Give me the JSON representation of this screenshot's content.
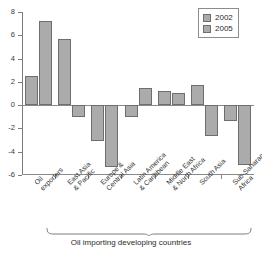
{
  "chart_data": {
    "type": "bar",
    "title": "",
    "xlabel": "",
    "ylabel": "",
    "ylim": [
      -6,
      8
    ],
    "grid": false,
    "legend_position": "top-right",
    "categories": [
      "Oil exporters",
      "East Asia & Pacific",
      "Europe & Central Asia",
      "Latin America & Caribbean",
      "Middle East & North Africa",
      "South Asia",
      "Sub-Saharan Africa"
    ],
    "category_lines": [
      [
        "Oil",
        "exporters"
      ],
      [
        "East Asia",
        "& Pacific"
      ],
      [
        "Europe &",
        "Central Asia"
      ],
      [
        "Latin America",
        "& Caribbean"
      ],
      [
        "Middle East",
        "& North Africa"
      ],
      [
        "South Asia"
      ],
      [
        "Sub-Saharan",
        "Africa"
      ]
    ],
    "series": [
      {
        "name": "2002",
        "values": [
          2.5,
          5.7,
          -3.1,
          -1.0,
          1.2,
          1.75,
          -1.35
        ]
      },
      {
        "name": "2005",
        "values": [
          7.2,
          -1.0,
          -5.3,
          1.5,
          1.05,
          -2.65,
          -5.1
        ]
      }
    ],
    "yticks": [
      8,
      6,
      4,
      2,
      0,
      -2,
      -4,
      -6
    ],
    "ytick_labels": [
      "8",
      "6",
      "4",
      "2",
      "0",
      "-2",
      "-4",
      "-6"
    ],
    "annotation": "Oil importing developing countries",
    "annotation_span_categories": [
      1,
      6
    ],
    "colors": {
      "bar_fill": "#ababab",
      "bar_border": "#6e6e6e",
      "axis": "#8a8a8a",
      "text": "#2b2b2b"
    }
  },
  "legend": {
    "items": [
      {
        "label": "2002"
      },
      {
        "label": "2005"
      }
    ]
  }
}
